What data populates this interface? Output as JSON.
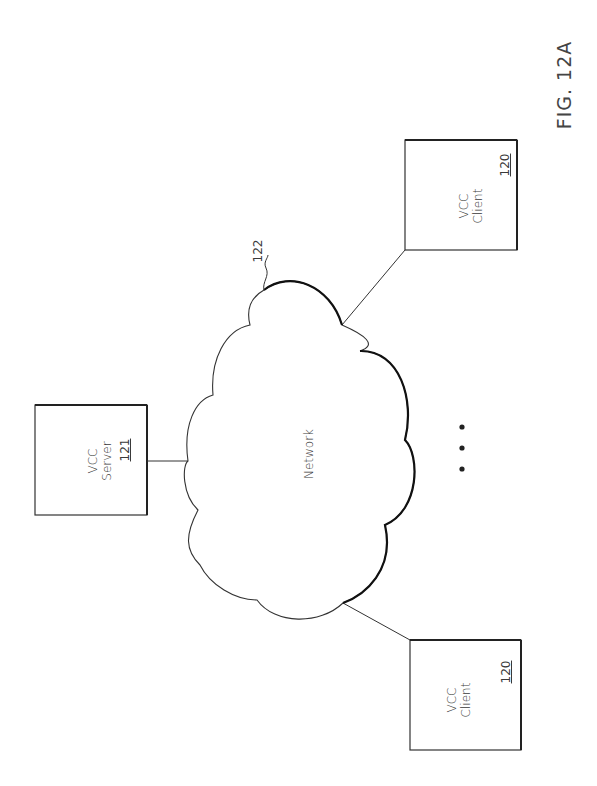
{
  "figure": {
    "label": "FIG. 12A"
  },
  "nodes": {
    "server": {
      "line1": "VCC",
      "line2": "Server",
      "ref": "121"
    },
    "client_top": {
      "line1": "VCC",
      "line2": "Client",
      "ref": "120"
    },
    "client_bottom": {
      "line1": "VCC",
      "line2": "Client",
      "ref": "120"
    },
    "network": {
      "label": "Network",
      "ref": "122"
    }
  },
  "ellipsis": "• • •"
}
